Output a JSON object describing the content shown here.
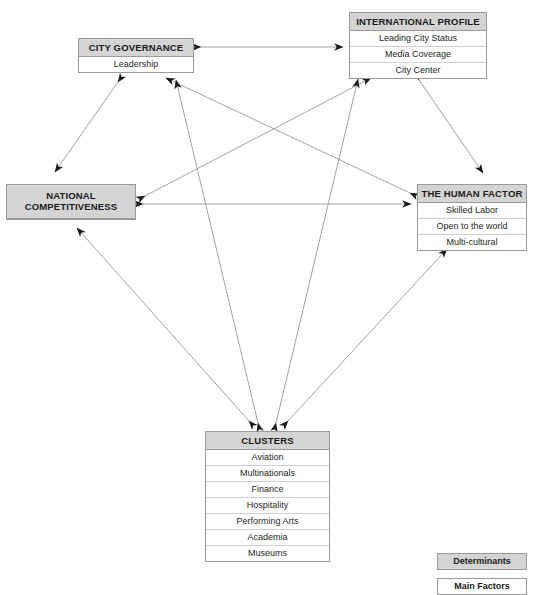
{
  "diagram": {
    "nodes": [
      {
        "id": "city-governance",
        "header": "CITY GOVERNANCE",
        "items": [
          "Leadership"
        ]
      },
      {
        "id": "international-profile",
        "header": "INTERNATIONAL PROFILE",
        "items": [
          "Leading City Status",
          "Media Coverage",
          "City Center"
        ]
      },
      {
        "id": "national-competitiveness",
        "header_line1": "NATIONAL",
        "header_line2": "COMPETITIVENESS",
        "items": []
      },
      {
        "id": "the-human-factor",
        "header": "THE HUMAN FACTOR",
        "items": [
          "Skilled Labor",
          "Open to the world",
          "Multi-cultural"
        ]
      },
      {
        "id": "clusters",
        "header": "CLUSTERS",
        "items": [
          "Aviation",
          "Multinationals",
          "Finance",
          "Hospitality",
          "Performing Arts",
          "Academia",
          "Museums"
        ]
      }
    ],
    "legend": {
      "determinants": "Determinants",
      "main_factors": "Main Factors"
    },
    "colors": {
      "header_fill": "#d4d4d4",
      "body_fill": "#ffffff",
      "border": "#9a9a9a",
      "edge": "#8c8c8c",
      "arrowhead": "#1a1a1a"
    },
    "edges": [
      {
        "from": "city-governance",
        "to": "international-profile",
        "direction": "both"
      },
      {
        "from": "city-governance",
        "to": "national-competitiveness",
        "direction": "both"
      },
      {
        "from": "international-profile",
        "to": "the-human-factor",
        "direction": "both"
      },
      {
        "from": "national-competitiveness",
        "to": "the-human-factor",
        "direction": "both"
      },
      {
        "from": "national-competitiveness",
        "to": "international-profile",
        "direction": "both"
      },
      {
        "from": "the-human-factor",
        "to": "city-governance",
        "direction": "both"
      },
      {
        "from": "clusters",
        "to": "city-governance",
        "direction": "both"
      },
      {
        "from": "clusters",
        "to": "international-profile",
        "direction": "both"
      },
      {
        "from": "clusters",
        "to": "national-competitiveness",
        "direction": "both"
      },
      {
        "from": "clusters",
        "to": "the-human-factor",
        "direction": "both"
      }
    ]
  }
}
